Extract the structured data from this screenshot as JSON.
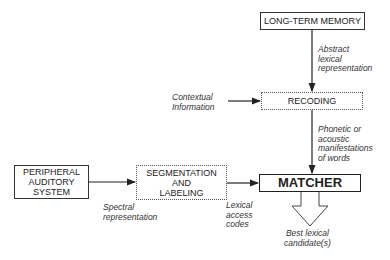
{
  "diagram": {
    "nodes": {
      "long_term_memory": "LONG-TERM MEMORY",
      "recoding": "RECODING",
      "peripheral": "PERIPHERAL\nAUDITORY\nSYSTEM",
      "segmentation": "SEGMENTATION\nAND\nLABELING",
      "matcher": "MATCHER"
    },
    "edge_labels": {
      "abstract": "Abstract\nlexical\nrepresentation",
      "contextual": "Contextual\nInformation",
      "phonetic": "Phonetic or\nacoustic\nmanifestations\nof words",
      "spectral": "Spectral\nrepresentation",
      "lexical_access": "Lexical\naccess\ncodes",
      "best_candidate": "Best lexical\ncandidate(s)"
    },
    "edges": [
      {
        "from": "long_term_memory",
        "to": "recoding",
        "label": "abstract"
      },
      {
        "from": "contextual_information",
        "to": "recoding"
      },
      {
        "from": "recoding",
        "to": "matcher",
        "label": "phonetic"
      },
      {
        "from": "peripheral",
        "to": "segmentation",
        "label": "spectral"
      },
      {
        "from": "segmentation",
        "to": "matcher",
        "label": "lexical_access"
      },
      {
        "from": "matcher",
        "to": "output",
        "label": "best_candidate"
      }
    ]
  }
}
